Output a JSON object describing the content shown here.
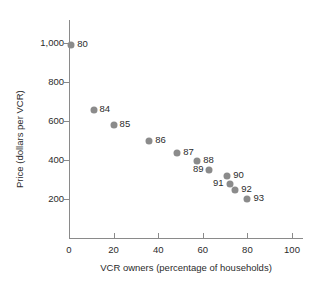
{
  "chart_data": {
    "type": "scatter",
    "title": "",
    "xlabel": "VCR owners (percentage of households)",
    "ylabel": "Price (dollars per VCR)",
    "xlim": [
      0,
      105
    ],
    "ylim": [
      0,
      1060
    ],
    "grid": false,
    "legend": "none",
    "marker_color": "#8b8b8b",
    "axis_color": "#8a8a8a",
    "text_color": "#2b2b2b",
    "xticks": [
      {
        "value": 0,
        "label": "0"
      },
      {
        "value": 20,
        "label": "20"
      },
      {
        "value": 40,
        "label": "40"
      },
      {
        "value": 60,
        "label": "60"
      },
      {
        "value": 80,
        "label": "80"
      },
      {
        "value": 100,
        "label": "100"
      }
    ],
    "yticks": [
      {
        "value": 200,
        "label": "200"
      },
      {
        "value": 400,
        "label": "400"
      },
      {
        "value": 600,
        "label": "600"
      },
      {
        "value": 800,
        "label": "800"
      },
      {
        "value": 1000,
        "label": "1,000"
      }
    ],
    "points": [
      {
        "label": "80",
        "x": 1,
        "y": 990,
        "label_side": "right"
      },
      {
        "label": "84",
        "x": 11,
        "y": 658,
        "label_side": "right"
      },
      {
        "label": "85",
        "x": 20,
        "y": 578,
        "label_side": "right"
      },
      {
        "label": "86",
        "x": 36,
        "y": 498,
        "label_side": "right"
      },
      {
        "label": "87",
        "x": 48.5,
        "y": 438,
        "label_side": "right"
      },
      {
        "label": "88",
        "x": 57.5,
        "y": 395,
        "label_side": "right"
      },
      {
        "label": "89",
        "x": 63,
        "y": 348,
        "label_side": "left"
      },
      {
        "label": "90",
        "x": 71,
        "y": 318,
        "label_side": "right"
      },
      {
        "label": "91",
        "x": 72,
        "y": 278,
        "label_side": "left"
      },
      {
        "label": "92",
        "x": 74.5,
        "y": 245,
        "label_side": "right"
      },
      {
        "label": "93",
        "x": 80,
        "y": 198,
        "label_side": "right"
      }
    ]
  }
}
